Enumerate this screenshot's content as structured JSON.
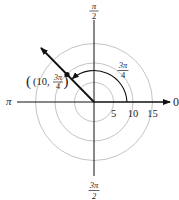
{
  "diagram": {
    "type": "polar-coordinate-plot",
    "colors": {
      "axis": "#111111",
      "grid_circle": "#bdbdbd",
      "ray": "#111111",
      "arc": "#111111",
      "text": "#222222",
      "background": "#ffffff"
    },
    "axis_labels": {
      "right": "0",
      "left": "π",
      "top": {
        "numerator": "π",
        "denominator": "2"
      },
      "bottom": {
        "numerator": "3π",
        "denominator": "2"
      }
    },
    "radial_ticks": [
      {
        "value": 5,
        "label": "5"
      },
      {
        "value": 10,
        "label": "10"
      },
      {
        "value": 15,
        "label": "15"
      }
    ],
    "point": {
      "r": 10,
      "theta": "3π/4",
      "label_prefix": "(10,",
      "label_numerator": "3π",
      "label_denominator": "4",
      "label_suffix": ")"
    },
    "angle_arc": {
      "from": "0",
      "to": "3π/4",
      "label_numerator": "3π",
      "label_denominator": "4"
    }
  }
}
